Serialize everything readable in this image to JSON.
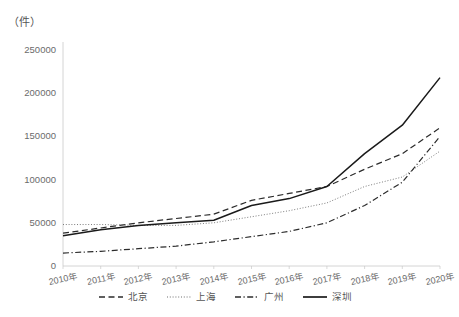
{
  "chart_data": {
    "type": "line",
    "title": "",
    "unit_label": "（件）",
    "xlabel": "",
    "ylabel": "",
    "categories": [
      "2010年",
      "2011年",
      "2012年",
      "2013年",
      "2014年",
      "2015年",
      "2016年",
      "2017年",
      "2018年",
      "2019年",
      "2020年"
    ],
    "yticks": [
      0,
      50000,
      100000,
      150000,
      200000,
      250000
    ],
    "ytick_labels": [
      "0",
      "50000",
      "100000",
      "150000",
      "200000",
      "250000"
    ],
    "ylim": [
      0,
      250000
    ],
    "grid": false,
    "legend_position": "bottom",
    "series": [
      {
        "name": "北京",
        "style": "dashed",
        "color": "#2b2b2b",
        "values": [
          38000,
          44000,
          50000,
          55000,
          60000,
          76000,
          84000,
          92000,
          112000,
          130000,
          160000
        ]
      },
      {
        "name": "上海",
        "style": "dotted",
        "color": "#6e6e6e",
        "values": [
          48000,
          48000,
          47000,
          47000,
          50000,
          57000,
          64000,
          73000,
          92000,
          103000,
          133000
        ]
      },
      {
        "name": "广州",
        "style": "dashdot",
        "color": "#2b2b2b",
        "values": [
          15000,
          17000,
          20000,
          23000,
          28000,
          34000,
          40000,
          50000,
          70000,
          97000,
          150000
        ]
      },
      {
        "name": "深圳",
        "style": "solid",
        "color": "#1a1a1a",
        "values": [
          35000,
          42000,
          47000,
          50000,
          53000,
          70000,
          78000,
          92000,
          130000,
          163000,
          218000
        ]
      }
    ]
  }
}
